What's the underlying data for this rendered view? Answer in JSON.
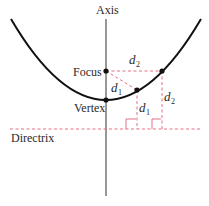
{
  "diagram": {
    "labels": {
      "axis": "Axis",
      "focus": "Focus",
      "vertex": "Vertex",
      "directrix": "Directrix",
      "d1_slant": "d",
      "d1_slant_sub": "1",
      "d1_vert": "d",
      "d1_vert_sub": "1",
      "d2_horiz": "d",
      "d2_horiz_sub": "2",
      "d2_vert": "d",
      "d2_vert_sub": "2"
    },
    "colors": {
      "curve": "#111111",
      "axis": "#333333",
      "dashed": "#e0607a",
      "text": "#2a2a2a"
    },
    "points": {
      "focus": [
        106,
        71
      ],
      "vertex": [
        106,
        100
      ],
      "p1": [
        137,
        90
      ],
      "p2": [
        162,
        71
      ],
      "directrix_y": 129
    }
  }
}
